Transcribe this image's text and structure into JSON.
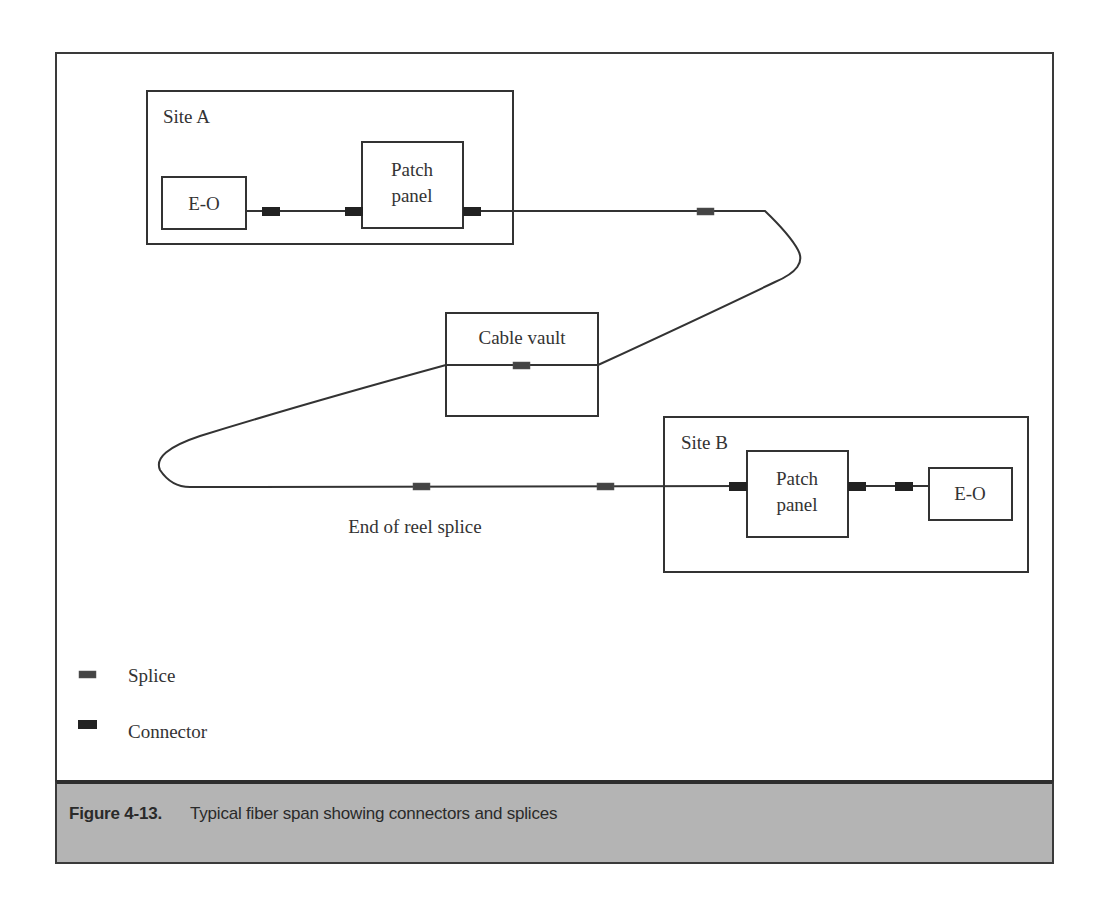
{
  "figure": {
    "caption_number": "Figure 4-13.",
    "caption_text": "Typical fiber span showing connectors and splices"
  },
  "diagram": {
    "site_a": {
      "label": "Site A",
      "eo_label": "E-O",
      "patch_panel_line1": "Patch",
      "patch_panel_line2": "panel"
    },
    "cable_vault": {
      "label": "Cable vault"
    },
    "site_b": {
      "label": "Site B",
      "eo_label": "E-O",
      "patch_panel_line1": "Patch",
      "patch_panel_line2": "panel"
    },
    "end_of_reel_label": "End of reel splice"
  },
  "legend": {
    "items": [
      {
        "symbol": "splice",
        "label": "Splice"
      },
      {
        "symbol": "connector",
        "label": "Connector"
      }
    ]
  },
  "colors": {
    "line": "#333333",
    "caption_bg": "#b4b4b4",
    "caption_border": "#2e2e2e"
  }
}
